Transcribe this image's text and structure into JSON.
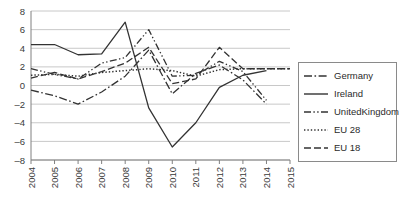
{
  "chart_data": {
    "type": "line",
    "title": "",
    "xlabel": "",
    "ylabel": "",
    "x": [
      2004,
      2005,
      2006,
      2007,
      2008,
      2009,
      2010,
      2011,
      2012,
      2013,
      2014,
      2015
    ],
    "xtick_labels": [
      "2004",
      "2005",
      "2006",
      "2007",
      "2008",
      "2009",
      "2010",
      "2011",
      "2012",
      "2013",
      "2014",
      "2015"
    ],
    "ytick_labels": [
      "8",
      "6",
      "4",
      "2",
      "0",
      "-2",
      "-4",
      "-6",
      "-8"
    ],
    "yticks": [
      8,
      6,
      4,
      2,
      0,
      -2,
      -4,
      -6,
      -8
    ],
    "ylim": [
      -8,
      8
    ],
    "xlim": [
      2004,
      2015
    ],
    "grid": true,
    "legend_position": "right",
    "series": [
      {
        "name": "Germany",
        "style": "dash-dot",
        "x": [
          2004,
          2005,
          2006,
          2007,
          2008,
          2009,
          2010,
          2011,
          2012,
          2013,
          2014
        ],
        "values": [
          -0.5,
          -1.1,
          -2.0,
          -0.7,
          1.0,
          3.8,
          -0.9,
          1.3,
          2.2,
          0.6,
          -2.0
        ]
      },
      {
        "name": "Ireland",
        "style": "solid",
        "x": [
          2004,
          2005,
          2006,
          2007,
          2008,
          2009,
          2010,
          2011,
          2012,
          2013,
          2014
        ],
        "values": [
          4.4,
          4.4,
          3.3,
          3.4,
          6.8,
          -2.4,
          -6.6,
          -4.0,
          -0.2,
          1.1,
          1.6
        ]
      },
      {
        "name": "UnitedKingdom",
        "style": "dash-dot-dot",
        "x": [
          2004,
          2005,
          2006,
          2007,
          2008,
          2009,
          2010,
          2011,
          2012,
          2013,
          2014
        ],
        "values": [
          1.8,
          1.2,
          0.7,
          2.4,
          3.0,
          6.0,
          1.0,
          1.1,
          2.6,
          1.5,
          -1.6
        ]
      },
      {
        "name": "EU 28",
        "style": "dotted",
        "x": [
          2004,
          2005,
          2006,
          2007,
          2008,
          2009,
          2010,
          2011,
          2012,
          2013,
          2014,
          2015
        ],
        "values": [
          1.1,
          1.2,
          1.0,
          1.4,
          1.6,
          1.8,
          1.6,
          1.0,
          1.7,
          1.8,
          1.8,
          1.8
        ]
      },
      {
        "name": "EU 18",
        "style": "dashed",
        "x": [
          2004,
          2005,
          2006,
          2007,
          2008,
          2009,
          2010,
          2011,
          2012,
          2013,
          2014,
          2015
        ],
        "values": [
          0.8,
          1.4,
          0.7,
          1.5,
          2.4,
          4.1,
          0.2,
          0.7,
          4.1,
          1.8,
          1.8,
          1.8
        ]
      }
    ]
  },
  "legend": {
    "items": [
      {
        "label": "Germany",
        "style": "dash-dot"
      },
      {
        "label": "Ireland",
        "style": "solid"
      },
      {
        "label": "UnitedKingdom",
        "style": "dash-dot-dot"
      },
      {
        "label": "EU 28",
        "style": "dotted"
      },
      {
        "label": "EU 18",
        "style": "dashed"
      }
    ]
  },
  "colors": {
    "line": "#333333",
    "grid": "#c8c8c8",
    "axis": "#808080",
    "text": "#3a3a3a"
  }
}
